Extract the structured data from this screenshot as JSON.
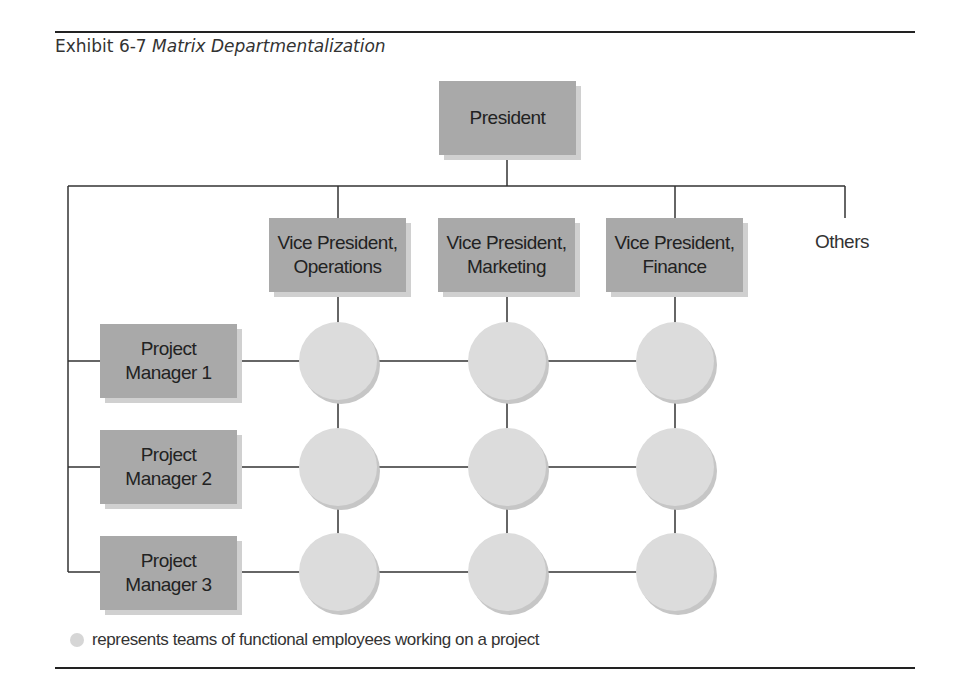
{
  "exhibit": {
    "label": "Exhibit 6-7",
    "title": "Matrix Departmentalization"
  },
  "top": {
    "label": "President"
  },
  "functional_heads": [
    {
      "label": "Vice President,\nOperations"
    },
    {
      "label": "Vice President,\nMarketing"
    },
    {
      "label": "Vice President,\nFinance"
    }
  ],
  "others_label": "Others",
  "project_managers": [
    {
      "label": "Project\nManager 1"
    },
    {
      "label": "Project\nManager 2"
    },
    {
      "label": "Project\nManager 3"
    }
  ],
  "legend": {
    "symbol": "gray-circle",
    "text": "represents teams of functional employees working on a project"
  },
  "colors": {
    "box": "#a9a9a9",
    "circle": "#dcdcdc",
    "line": "#333333"
  }
}
